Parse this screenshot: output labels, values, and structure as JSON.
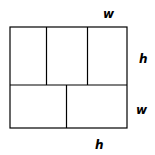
{
  "diagram": {
    "top_row_count": 3,
    "bottom_row_count": 2,
    "labels": {
      "top": "w",
      "right_upper": "h",
      "right_lower": "w",
      "bottom": "h"
    },
    "colors": {
      "line": "#000000",
      "background": "#ffffff"
    }
  }
}
